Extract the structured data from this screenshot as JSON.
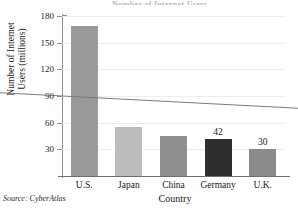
{
  "chart_data": {
    "type": "bar",
    "title": "Number of Internet Users",
    "xlabel": "Country",
    "ylabel_line1": "Number of Internet",
    "ylabel_line2": "Users (millions)",
    "categories": [
      "U.S.",
      "Japan",
      "China",
      "Germany",
      "U.K."
    ],
    "values": [
      169,
      55,
      45,
      42,
      30
    ],
    "point_labels": [
      "",
      "",
      "",
      "42",
      "30"
    ],
    "bar_colors": [
      "#9a9a9a",
      "#bcbcbc",
      "#8f8f8f",
      "#2e2e2e",
      "#8b8b8b"
    ],
    "ylim": [
      0,
      180
    ],
    "yticks": [
      180,
      150,
      120,
      90,
      60,
      30
    ],
    "grid": true,
    "legend": "none",
    "trendline": {
      "label": "",
      "start_value": 90,
      "end_value": 77,
      "color": "#7a7a7a"
    },
    "source_note": "Source: CyberAtlas"
  }
}
